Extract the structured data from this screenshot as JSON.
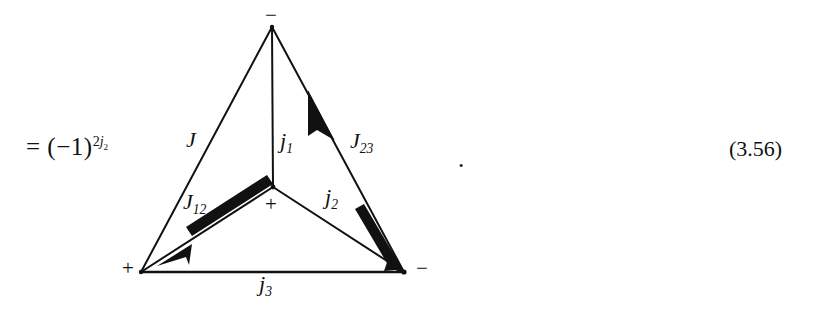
{
  "equation": {
    "lhs": {
      "equals": "=",
      "open_paren": "(",
      "minus": "−",
      "one": "1",
      "close_paren": ")",
      "exponent_coefficient": "2",
      "exponent_symbol": "j",
      "exponent_subscript": "2",
      "full_text": "= (−1)^{2j₂}"
    },
    "trailing_punctuation": ".",
    "number": "(3.56)"
  },
  "diagram": {
    "type": "angular-momentum-coupling-triangle",
    "edge_labels": [
      {
        "name": "J",
        "symbol": "J",
        "subscript": ""
      },
      {
        "name": "j1",
        "symbol": "j",
        "subscript": "1"
      },
      {
        "name": "J23",
        "symbol": "J",
        "subscript": "23"
      },
      {
        "name": "J12",
        "symbol": "J",
        "subscript": "12"
      },
      {
        "name": "j2",
        "symbol": "j",
        "subscript": "2"
      },
      {
        "name": "j3",
        "symbol": "j",
        "subscript": "3"
      }
    ],
    "vertex_signs": {
      "top": "−",
      "center": "+",
      "bottom_left": "+",
      "bottom_right": "−"
    },
    "colors": {
      "ink": "#111111",
      "background": "#ffffff"
    },
    "line_weight_thin": 2,
    "line_weight_thick": 9,
    "arrow_count": 3
  }
}
